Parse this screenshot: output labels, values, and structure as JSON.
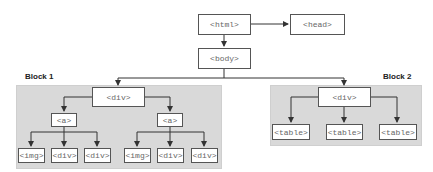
{
  "diagram": {
    "nodes": {
      "html": "<html>",
      "head": "<head>",
      "body": "<body>",
      "block1_div": "<div>",
      "block1_a_left": "<a>",
      "block1_a_right": "<a>",
      "block1_left_img": "<img>",
      "block1_left_div1": "<div>",
      "block1_left_div2": "<div>",
      "block1_right_img": "<img>",
      "block1_right_div1": "<div>",
      "block1_right_div2": "<div>",
      "block2_div": "<div>",
      "block2_table1": "<table>",
      "block2_table2": "<table>",
      "block2_table3": "<table>"
    },
    "groups": {
      "block1_label": "Block 1",
      "block2_label": "Block 2"
    },
    "colors": {
      "block_fill": "#d9d9d9",
      "node_border": "#555555",
      "edge": "#333333",
      "node_text": "#666666"
    }
  }
}
